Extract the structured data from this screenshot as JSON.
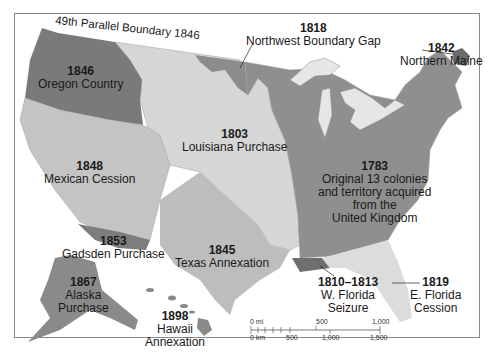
{
  "map": {
    "title_arc": "49th Parallel Boundary 1846",
    "colors": {
      "original_13": "#8f8f8f",
      "louisiana": "#d6d6d6",
      "oregon": "#7a7a7a",
      "mexican_cession": "#c4c4c4",
      "texas": "#bdbdbd",
      "gadsden": "#7d7d7d",
      "northwest_gap": "#8c8c8c",
      "northern_maine": "#6a6a6a",
      "w_florida": "#6e6e6e",
      "e_florida": "#dcdcdc",
      "alaska": "#8a8a8a",
      "hawaii": "#8a8a8a",
      "water": "#ffffff",
      "great_lakes": "#e6e6e6",
      "border": "#8a8a8a"
    },
    "regions": [
      {
        "year": "1846",
        "name": "Oregon Country"
      },
      {
        "year": "1818",
        "name": "Northwest Boundary Gap"
      },
      {
        "year": "1842",
        "name": "Northern Maine"
      },
      {
        "year": "1803",
        "name": "Louisiana Purchase"
      },
      {
        "year": "1848",
        "name": "Mexican Cession"
      },
      {
        "year": "1783",
        "name_lines": [
          "Original 13 colonies",
          "and territory acquired",
          "from the",
          "United Kingdom"
        ]
      },
      {
        "year": "1853",
        "name": "Gadsden Purchase"
      },
      {
        "year": "1845",
        "name": "Texas Annexation"
      },
      {
        "year": "1867",
        "name_lines": [
          "Alaska",
          "Purchase"
        ]
      },
      {
        "year": "1898",
        "name_lines": [
          "Hawaii",
          "Annexation"
        ]
      },
      {
        "year": "1810–1813",
        "name_lines": [
          "W. Florida",
          "Seizure"
        ]
      },
      {
        "year": "1819",
        "name_lines": [
          "E. Florida",
          "Cession"
        ]
      }
    ],
    "scale_bar": {
      "mi_label": "0 mi",
      "mi_ticks": [
        "500",
        "1,000"
      ],
      "km_label": "0 km",
      "km_ticks": [
        "500",
        "1,000",
        "1,500"
      ]
    }
  }
}
